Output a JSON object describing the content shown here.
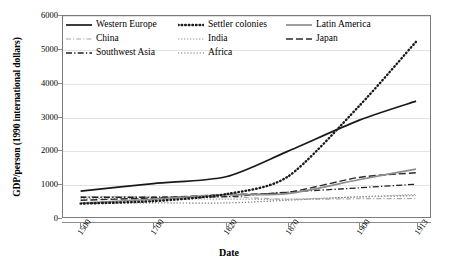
{
  "chart_data": {
    "type": "line",
    "title": "",
    "xlabel": "Date",
    "ylabel": "GDP/person (1990 international dollars)",
    "x": [
      "1500",
      "1700",
      "1820",
      "1870",
      "1900",
      "1913"
    ],
    "categories": [
      "1500",
      "1700",
      "1820",
      "1870",
      "1900",
      "1913"
    ],
    "ylim": [
      0,
      6000
    ],
    "yticks": [
      "0",
      "1000",
      "2000",
      "3000",
      "4000",
      "5000",
      "6000"
    ],
    "grid": true,
    "legend_position": "top-inside",
    "series": [
      {
        "name": "Western Europe",
        "values": [
          771,
          997,
          1202,
          1960,
          2885,
          3458
        ],
        "color": "#1a1a1a",
        "style": "solid",
        "width": 1.7,
        "dash": ""
      },
      {
        "name": "Settler colonies",
        "values": [
          400,
          473,
          683,
          1201,
          3302,
          5233
        ],
        "color": "#1a1a1a",
        "style": "dotted",
        "width": 2.4,
        "dash": "0.6 3.0"
      },
      {
        "name": "Latin America",
        "values": [
          416,
          529,
          665,
          698,
          1113,
          1430
        ],
        "color": "#8d8d8d",
        "style": "solid",
        "width": 1.7,
        "dash": ""
      },
      {
        "name": "China",
        "values": [
          600,
          600,
          600,
          530,
          545,
          552
        ],
        "color": "#a8a8a8",
        "style": "dash-dot",
        "width": 1.2,
        "dash": "5 2 1.2 2"
      },
      {
        "name": "India",
        "values": [
          550,
          550,
          533,
          533,
          599,
          673
        ],
        "color": "#9c9c9c",
        "style": "fine-dotted",
        "width": 1.2,
        "dash": "1.3 1.7"
      },
      {
        "name": "Japan",
        "values": [
          500,
          570,
          669,
          737,
          1180,
          1320
        ],
        "color": "#2b2b2b",
        "style": "long-dash",
        "width": 1.4,
        "dash": "7 3"
      },
      {
        "name": "Southwest Asia",
        "values": [
          590,
          590,
          607,
          742,
          870,
          980
        ],
        "color": "#1f1f1f",
        "style": "dash-dot",
        "width": 1.3,
        "dash": "6 2.2 1.3 2.2"
      },
      {
        "name": "Africa",
        "values": [
          414,
          421,
          420,
          500,
          601,
          637
        ],
        "color": "#6f6f6f",
        "style": "fine-dotted",
        "width": 1.2,
        "dash": "1.2 1.9"
      }
    ]
  },
  "legend": {
    "order": [
      "Western Europe",
      "Settler colonies",
      "Latin America",
      "China",
      "India",
      "Japan",
      "Southwest Asia",
      "Africa"
    ]
  },
  "colors": {
    "axis": "#7b7b7b",
    "grid": "#e2e2e2",
    "text": "#000000",
    "background": "#ffffff"
  }
}
